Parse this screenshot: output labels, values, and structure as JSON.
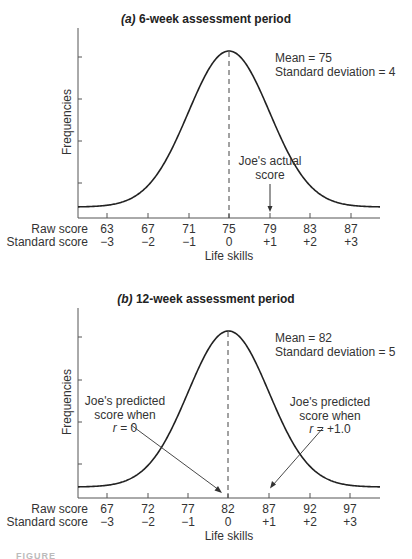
{
  "chart_data": [
    {
      "type": "line",
      "title": "(a) 6-week assessment period",
      "title_prefix": "(a)",
      "title_rest": " 6-week assessment period",
      "ylabel": "Frequencies",
      "xlabel": "Life skills",
      "distribution": "normal",
      "mean": 75,
      "sd": 4,
      "stats": {
        "mean_text": "Mean = 75",
        "sd_text": "Standard deviation = 4"
      },
      "row_labels": {
        "raw": "Raw score",
        "standard": "Standard score"
      },
      "raw_scores": [
        "63",
        "67",
        "71",
        "75",
        "79",
        "83",
        "87"
      ],
      "standard_scores": [
        "−3",
        "−2",
        "−1",
        "0",
        "+1",
        "+2",
        "+3"
      ],
      "x_range": [
        60.2,
        89.6
      ],
      "mean_line": "dashed vertical at 75",
      "annotations": [
        {
          "text_line1": "Joe's actual",
          "text_line2": "score",
          "points_to_raw": 79,
          "points_to_standard": "+1"
        }
      ],
      "grid": false,
      "legend": null
    },
    {
      "type": "line",
      "title": "(b) 12-week assessment period",
      "title_prefix": "(b)",
      "title_rest": " 12-week assessment period",
      "ylabel": "Frequencies",
      "xlabel": "Life skills",
      "distribution": "normal",
      "mean": 82,
      "sd": 5,
      "stats": {
        "mean_text": "Mean = 82",
        "sd_text": "Standard deviation = 5"
      },
      "row_labels": {
        "raw": "Raw score",
        "standard": "Standard score"
      },
      "raw_scores": [
        "67",
        "72",
        "77",
        "82",
        "87",
        "92",
        "97"
      ],
      "standard_scores": [
        "−3",
        "−2",
        "−1",
        "0",
        "+1",
        "+2",
        "+3"
      ],
      "x_range": [
        63.5,
        100.5
      ],
      "mean_line": "dashed vertical at 82",
      "annotations": [
        {
          "text_line1": "Joe's predicted",
          "text_line2": "score when",
          "text_line3_var": "r",
          "text_line3_rest": " = 0",
          "points_to_raw": 82,
          "points_to_standard": "0"
        },
        {
          "text_line1": "Joe's predicted",
          "text_line2": "score when",
          "text_line3_var": "r",
          "text_line3_rest": " = +1.0",
          "points_to_raw": 87,
          "points_to_standard": "+1"
        }
      ],
      "grid": false,
      "legend": null
    }
  ],
  "caption_fragment": "FIGURE"
}
